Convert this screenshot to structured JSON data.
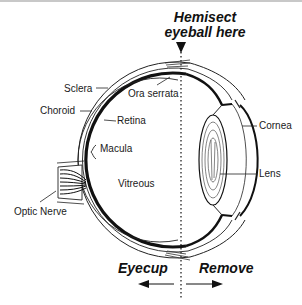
{
  "title": {
    "line1": "Hemisect",
    "line2": "eyeball here"
  },
  "labels": {
    "sclera": "Sclera",
    "choroid": "Choroid",
    "retina": "Retina",
    "macula": "Macula",
    "ora_serrata": "Ora serrata",
    "vitreous": "Vitreous",
    "cornea": "Cornea",
    "lens": "Lens",
    "optic_nerve": "Optic Nerve"
  },
  "directions": {
    "left": "Eyecup",
    "right": "Remove"
  },
  "colors": {
    "ink": "#111111",
    "background": "#ffffff"
  }
}
